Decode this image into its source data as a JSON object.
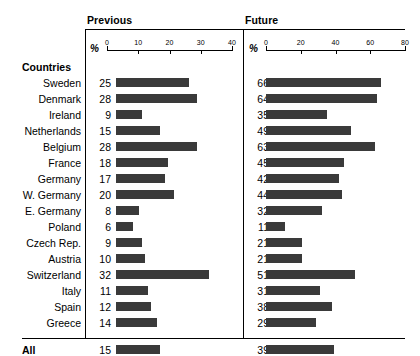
{
  "panels": {
    "previous": {
      "title": "Previous",
      "unit": "%",
      "ticks": [
        0,
        10,
        20,
        30,
        40
      ]
    },
    "future": {
      "title": "Future",
      "unit": "%",
      "ticks": [
        0,
        20,
        40,
        60,
        80
      ]
    }
  },
  "row_header": "Countries",
  "summary_label": "All",
  "colors": {
    "bar": "#3a3a3a",
    "rule": "#000000",
    "background": "#ffffff"
  },
  "chart_data": {
    "type": "bar",
    "title": "",
    "xlabel": "%",
    "ylabel": "Countries",
    "grid": false,
    "legend_position": "none",
    "orientation": "horizontal",
    "panels": [
      "Previous",
      "Future"
    ],
    "xlim_previous": [
      0,
      40
    ],
    "xlim_future": [
      0,
      80
    ],
    "categories": [
      "Sweden",
      "Denmark",
      "Ireland",
      "Netherlands",
      "Belgium",
      "France",
      "Germany",
      "W. Germany",
      "E. Germany",
      "Poland",
      "Czech Rep.",
      "Austria",
      "Switzerland",
      "Italy",
      "Spain",
      "Greece"
    ],
    "series": [
      {
        "name": "Previous",
        "values": [
          25,
          28,
          9,
          15,
          28,
          18,
          17,
          20,
          8,
          6,
          9,
          10,
          32,
          11,
          12,
          14
        ]
      },
      {
        "name": "Future",
        "values": [
          66,
          64,
          35,
          49,
          63,
          45,
          42,
          44,
          32,
          11,
          21,
          21,
          51,
          31,
          38,
          29
        ]
      }
    ],
    "summary": {
      "label": "All",
      "previous": 15,
      "future": 39
    }
  }
}
